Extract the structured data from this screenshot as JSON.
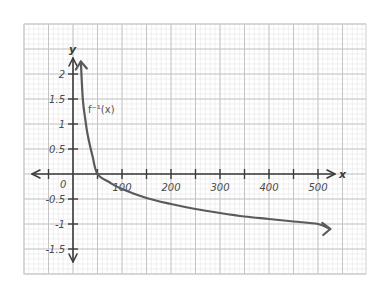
{
  "chart_data": {
    "type": "line",
    "title": "",
    "xlabel": "x",
    "ylabel": "y",
    "xlim": [
      -100,
      600
    ],
    "ylim": [
      -2,
      2.5
    ],
    "grid": true,
    "x_ticks": [
      100,
      200,
      300,
      400,
      500
    ],
    "x_tick_labels": [
      "100",
      "200",
      "300",
      "400",
      "500"
    ],
    "x_minor_ticks": [
      -50,
      50,
      150,
      250,
      350,
      450
    ],
    "y_ticks": [
      2,
      1.5,
      1,
      0.5,
      -0.5,
      -1,
      -1.5
    ],
    "y_tick_labels": [
      "2",
      "1.5",
      "1",
      "0.5",
      "-0.5",
      "-1",
      "-1.5"
    ],
    "origin_label": "0",
    "series": [
      {
        "name": "f⁻¹(x)",
        "label_text": "f⁻¹(x)",
        "description": "decreasing logarithmic curve, arrows at both ends",
        "x": [
          16,
          20,
          25,
          30,
          40,
          50,
          75,
          100,
          150,
          200,
          250,
          300,
          350,
          400,
          450,
          500,
          525
        ],
        "y": [
          2.25,
          1.5,
          1.1,
          0.78,
          0.35,
          0.0,
          -0.17,
          -0.3,
          -0.48,
          -0.6,
          -0.7,
          -0.78,
          -0.85,
          -0.9,
          -0.95,
          -1.0,
          -1.1
        ]
      }
    ],
    "legend": "inline label near curve (upper left)"
  },
  "colors": {
    "curve": "#5a5a5a",
    "axis": "#3c3c3c",
    "major_grid": "#c4c4c4",
    "minor_grid": "#e6e6e6",
    "background": "#ffffff"
  }
}
